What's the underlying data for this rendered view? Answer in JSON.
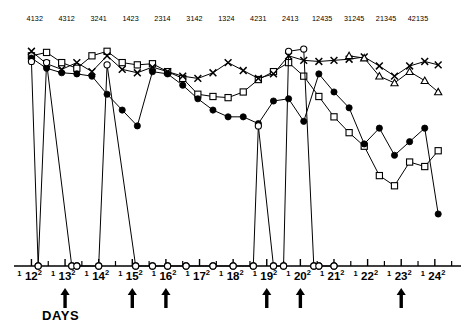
{
  "chart_data": {
    "type": "line",
    "title": "",
    "xlabel": "DAYS",
    "ylabel": "",
    "grid": false,
    "legend_position": "none",
    "x_axis": {
      "days": [
        12,
        13,
        14,
        15,
        16,
        17,
        18,
        19,
        20,
        21,
        22,
        23,
        24
      ],
      "day_superscript": "2",
      "minor_tick_label": "1",
      "range": [
        11.6,
        24.6
      ]
    },
    "ylim": [
      0,
      10
    ],
    "arrow_days": [
      13,
      15,
      16,
      19,
      20,
      23
    ],
    "top_labels": [
      "4132",
      "4312",
      "3241",
      "1423",
      "2314",
      "3142",
      "1324",
      "4231",
      "2413",
      "12435",
      "31245",
      "21345",
      "42135"
    ],
    "top_label_days": [
      12.1,
      13.05,
      14.0,
      14.95,
      15.9,
      16.85,
      17.8,
      18.75,
      19.7,
      20.65,
      21.6,
      22.55,
      23.5
    ],
    "series": [
      {
        "name": "open-square",
        "marker": "square-open",
        "x": [
          12.0,
          12.45,
          12.9,
          13.35,
          13.8,
          14.25,
          14.7,
          15.15,
          15.6,
          16.05,
          16.5,
          16.95,
          17.4,
          17.85,
          18.3,
          18.75,
          19.2,
          19.65,
          20.1,
          20.55,
          21.0,
          21.45,
          21.9,
          22.35,
          22.8,
          23.25,
          23.7,
          24.1
        ],
        "values": [
          9.3,
          9.45,
          9.0,
          8.75,
          9.3,
          9.5,
          9.0,
          8.9,
          8.95,
          8.6,
          8.3,
          7.6,
          7.5,
          7.45,
          7.7,
          8.25,
          8.6,
          9.0,
          8.4,
          7.5,
          6.6,
          5.9,
          5.3,
          4.0,
          3.55,
          4.6,
          4.4,
          5.1
        ]
      },
      {
        "name": "cross",
        "marker": "cross",
        "x": [
          12.0,
          12.45,
          12.9,
          13.35,
          13.8,
          14.25,
          14.7,
          15.15,
          15.6,
          16.05,
          16.5,
          16.95,
          17.4,
          17.85,
          18.3,
          18.75,
          19.2,
          19.65,
          20.1,
          20.55,
          21.0,
          21.45,
          21.9,
          22.35,
          22.8,
          23.25,
          23.7,
          24.1
        ],
        "values": [
          9.5,
          8.95,
          8.7,
          9.0,
          8.6,
          9.3,
          8.7,
          8.55,
          8.8,
          8.6,
          8.4,
          8.3,
          8.55,
          9.0,
          8.65,
          8.3,
          8.5,
          9.3,
          9.1,
          9.05,
          9.1,
          9.15,
          9.25,
          8.85,
          8.4,
          8.85,
          9.05,
          8.9
        ]
      },
      {
        "name": "filled-circle",
        "marker": "circle-filled",
        "x": [
          12.0,
          12.45,
          12.9,
          13.35,
          13.8,
          14.25,
          14.7,
          15.15,
          15.6,
          16.05,
          16.5,
          16.95,
          17.4,
          17.85,
          18.3,
          18.75,
          19.2,
          19.65,
          20.1,
          20.55,
          21.0,
          21.45,
          21.9,
          22.35,
          22.8,
          23.25,
          23.7,
          24.1
        ],
        "values": [
          9.2,
          8.75,
          8.55,
          8.5,
          8.4,
          7.6,
          6.9,
          6.2,
          8.6,
          8.5,
          8.0,
          7.4,
          6.9,
          6.6,
          6.6,
          6.3,
          7.3,
          7.4,
          6.4,
          8.5,
          7.7,
          7.0,
          5.4,
          6.1,
          4.9,
          5.5,
          6.1,
          2.3
        ]
      },
      {
        "name": "open-circle",
        "marker": "circle-open",
        "x": [
          12.0,
          12.2,
          12.45,
          13.2,
          13.35,
          14.0,
          14.25,
          15.1,
          15.6,
          16.05,
          16.6,
          17.4,
          18.0,
          18.6,
          18.75,
          19.2,
          19.5,
          19.65,
          20.1,
          20.4,
          20.55,
          21.0
        ],
        "values": [
          9.05,
          0.0,
          9.0,
          0.0,
          0.0,
          0.0,
          8.9,
          0.0,
          0.0,
          0.0,
          0.0,
          0.0,
          0.0,
          0.0,
          6.2,
          0.0,
          0.0,
          9.5,
          9.6,
          0.0,
          0.0,
          0.0
        ]
      },
      {
        "name": "open-triangle",
        "marker": "triangle-open",
        "x": [
          21.45,
          21.9,
          22.35,
          22.8,
          23.25,
          23.7,
          24.1
        ],
        "values": [
          9.3,
          9.2,
          8.4,
          8.1,
          8.6,
          8.2,
          7.7
        ]
      }
    ]
  }
}
